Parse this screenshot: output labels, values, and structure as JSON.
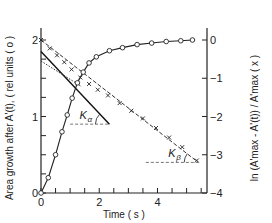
{
  "chart_data": {
    "type": "line",
    "title": "",
    "xlabel": "Time ( s )",
    "ylabel_left": "Area growth after A'(t), ( rel units ( o )",
    "ylabel_right": "ln (A'max - A'(t)) / A'max ( x )",
    "xlim": [
      0,
      5.7
    ],
    "ylim_left": [
      0,
      2
    ],
    "ylim_right": [
      -4,
      0
    ],
    "x_ticks": [
      0,
      0.5,
      1,
      1.5,
      2,
      2.5,
      3,
      3.5,
      4,
      4.5,
      5,
      5.5
    ],
    "x_tick_labels": [
      {
        "value": 0,
        "label": "0"
      },
      {
        "value": 2,
        "label": "2"
      },
      {
        "value": 4,
        "label": "4"
      }
    ],
    "y_left_ticks": [
      0,
      0.25,
      0.5,
      0.75,
      1,
      1.25,
      1.5,
      1.75,
      2
    ],
    "y_left_tick_labels": [
      {
        "value": 0,
        "label": "0"
      },
      {
        "value": 1,
        "label": "1"
      },
      {
        "value": 2,
        "label": "2"
      }
    ],
    "y_right_ticks": [
      0,
      -1,
      -2,
      -3,
      -4
    ],
    "y_right_tick_labels": [
      {
        "value": 0,
        "label": "0"
      },
      {
        "value": -1,
        "label": "-1"
      },
      {
        "value": -2,
        "label": "-2"
      },
      {
        "value": -3,
        "label": "-3"
      },
      {
        "value": -4,
        "label": "-4"
      }
    ],
    "grid": false,
    "series": [
      {
        "name": "Area growth (o)",
        "axis": "left",
        "marker": "circle",
        "x": [
          0.0,
          0.25,
          0.5,
          0.72,
          0.9,
          1.07,
          1.25,
          1.45,
          1.65,
          1.9,
          2.35,
          2.8,
          3.3,
          3.8,
          4.3,
          4.8,
          5.2
        ],
        "values": [
          0.0,
          0.2,
          0.5,
          0.8,
          1.02,
          1.24,
          1.44,
          1.58,
          1.7,
          1.78,
          1.86,
          1.9,
          1.94,
          1.96,
          1.98,
          1.99,
          2.0
        ]
      },
      {
        "name": "ln term (x)",
        "axis": "right",
        "marker": "cross",
        "x": [
          0.0,
          0.3,
          0.55,
          0.8,
          1.05,
          1.35,
          1.65,
          1.95,
          2.3,
          2.7,
          3.1,
          3.5,
          3.95,
          4.4,
          4.85,
          5.35
        ],
        "values": [
          0.0,
          -0.22,
          -0.4,
          -0.58,
          -0.77,
          -0.98,
          -1.15,
          -1.3,
          -1.45,
          -1.65,
          -1.85,
          -2.05,
          -2.3,
          -2.55,
          -2.8,
          -3.15
        ]
      }
    ],
    "fit_lines": [
      {
        "name": "fast component fit (solid)",
        "axis": "right",
        "x": [
          0.0,
          2.35
        ],
        "values": [
          -0.3,
          -2.2
        ]
      },
      {
        "name": "fast extrapolation (dotted)",
        "axis": "right",
        "x": [
          0.0,
          1.4
        ],
        "values": [
          -0.55,
          -1.22
        ]
      },
      {
        "name": "slow component fit (dashed)",
        "axis": "right",
        "x": [
          0.0,
          5.4
        ],
        "values": [
          0.0,
          -3.2
        ]
      }
    ],
    "reference_lines": [
      {
        "name": "K-alpha baseline",
        "axis": "right",
        "x": [
          1.0,
          2.3
        ],
        "value": -2.2
      },
      {
        "name": "K-beta baseline",
        "axis": "right",
        "x": [
          3.6,
          5.4
        ],
        "value": -3.2
      }
    ],
    "annotations": [
      {
        "text": "K",
        "sub": "α",
        "near": "fast slope angle"
      },
      {
        "text": "K",
        "sub": "β",
        "near": "slow slope angle"
      }
    ]
  }
}
